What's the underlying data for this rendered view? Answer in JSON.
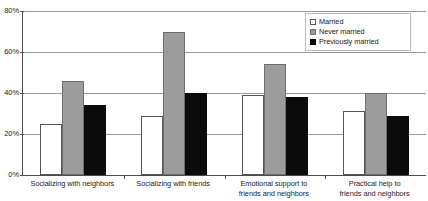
{
  "chart_data": {
    "type": "bar",
    "title": "",
    "xlabel": "",
    "ylabel": "",
    "ylim": [
      0,
      80
    ],
    "grid": true,
    "legend_position": "top-right",
    "ytick_labels": [
      "80%",
      "60%",
      "40%",
      "20%",
      "0%"
    ],
    "ytick_values": [
      80,
      60,
      40,
      20,
      0
    ],
    "categories": [
      "Socializing with neighbors",
      "Socializing with friends",
      "Emotional support to friends and neighbors",
      "Practical help to friends and neighbors"
    ],
    "category_lines": [
      [
        "Socializing with neighbors"
      ],
      [
        "Socializing with friends"
      ],
      [
        "Emotional support to",
        "friends and neighbors"
      ],
      [
        "Practical help to",
        "friends and neighbors"
      ]
    ],
    "series": [
      {
        "name": "Married",
        "color": "#ffffff",
        "border": "#555555",
        "values": [
          25,
          29,
          39,
          31
        ]
      },
      {
        "name": "Never married",
        "color": "#9c9c9c",
        "border": "#6e6e6e",
        "values": [
          46,
          70,
          54,
          40
        ]
      },
      {
        "name": "Previously married",
        "color": "#0b0b0b",
        "border": "#0b0b0b",
        "values": [
          34,
          40,
          38,
          29
        ]
      }
    ]
  },
  "legend": {
    "items": [
      {
        "label": "Married",
        "swatch": "married"
      },
      {
        "label": "Never married",
        "swatch": "never"
      },
      {
        "label": "Previously married",
        "swatch": "prev"
      }
    ]
  },
  "colors": {
    "axis": "#4d4d4d",
    "gridline": "#9a9a9a",
    "text": "#1a1a1a",
    "background": "#ffffff"
  }
}
